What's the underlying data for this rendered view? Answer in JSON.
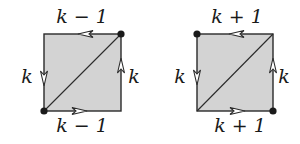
{
  "colors": {
    "fill": "#d3d3d3",
    "stroke": "#2a2a2a",
    "vertex": "#1a1a1a",
    "background": "#ffffff"
  },
  "figures": [
    {
      "id": "left-square",
      "labels": {
        "top": "k − 1",
        "bottom": "k − 1",
        "left": "k",
        "right": "k"
      },
      "vertices_marked": [
        "top-right",
        "bottom-left"
      ],
      "diagonal": "bottom-left to top-right",
      "arrows": {
        "top": "left",
        "bottom": "right",
        "left": "down",
        "right": "up"
      }
    },
    {
      "id": "right-square",
      "labels": {
        "top": "k + 1",
        "bottom": "k + 1",
        "left": "k",
        "right": "k"
      },
      "vertices_marked": [
        "top-left",
        "bottom-right"
      ],
      "diagonal": "bottom-left to top-right",
      "arrows": {
        "top": "left",
        "bottom": "right",
        "left": "down",
        "right": "up"
      }
    }
  ]
}
